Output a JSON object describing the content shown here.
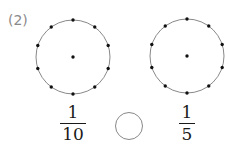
{
  "problem": {
    "label": "(2)",
    "left": {
      "circle": {
        "cx": 73,
        "cy": 57,
        "r": 37,
        "points_on_circle": 10,
        "center_dot": true
      },
      "fraction": {
        "numerator": "1",
        "denominator": "10"
      }
    },
    "right": {
      "circle": {
        "cx": 187,
        "cy": 56,
        "r": 37,
        "points_on_circle": 10,
        "center_dot": true
      },
      "fraction": {
        "numerator": "1",
        "denominator": "5"
      }
    },
    "comparison_blank": ""
  },
  "colors": {
    "circle_stroke": "#888888",
    "dot": "#111111",
    "label": "#8a8a8a",
    "text": "#1a1a1a"
  }
}
